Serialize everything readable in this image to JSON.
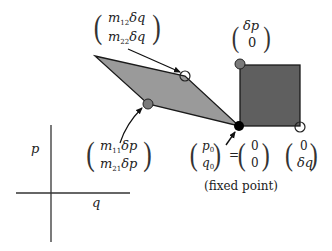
{
  "diagram": {
    "axes": {
      "vertical_label": "p",
      "horizontal_label": "q"
    },
    "fixed_point": {
      "vector_top": "p",
      "vector_top_sub": "0",
      "vector_bottom": "q",
      "vector_bottom_sub": "0",
      "equals": "=",
      "value_top": "0",
      "value_bottom": "0",
      "caption": "(fixed point)"
    },
    "square_top_vector": {
      "top": "δp",
      "bottom": "0"
    },
    "square_right_vector": {
      "top": "0",
      "bottom": "δq"
    },
    "parallelogram_top_vector": {
      "top_m": "m",
      "top_sub": "12",
      "top_d": "δq",
      "bottom_m": "m",
      "bottom_sub": "22",
      "bottom_d": "δq"
    },
    "parallelogram_left_vector": {
      "top_m": "m",
      "top_sub": "11",
      "top_d": "δp",
      "bottom_m": "m",
      "bottom_sub": "21",
      "bottom_d": "δp"
    },
    "colors": {
      "square_fill": "#5f5f5f",
      "parallelogram_fill": "#9a9a9a",
      "outline": "#1a1a1a",
      "gray_marker": "#7a7a7a",
      "fixed_point_marker": "#000000",
      "open_marker": "#ffffff"
    }
  }
}
